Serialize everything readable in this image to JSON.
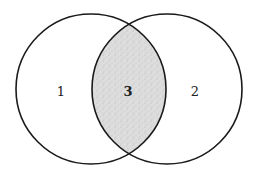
{
  "diagram": {
    "type": "venn",
    "sets": [
      {
        "id": "left",
        "label": "1"
      },
      {
        "id": "right",
        "label": "2"
      }
    ],
    "intersection": {
      "label": "3",
      "shaded": true
    },
    "colors": {
      "stroke": "#1a1a1a",
      "intersection_fill": "#d4d4d4",
      "background": "#ffffff"
    }
  }
}
